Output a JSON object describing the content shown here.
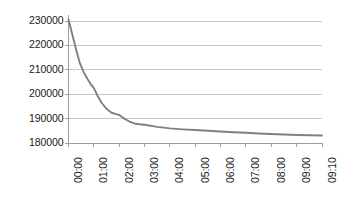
{
  "chart_data": {
    "type": "line",
    "title": "",
    "subtitle": "",
    "xlabel": "",
    "ylabel": "",
    "grid": "horizontal",
    "legend": "none",
    "ylim": [
      180000,
      230000
    ],
    "ytick_step": 10000,
    "ytick_labels": [
      "230000",
      "220000",
      "210000",
      "200000",
      "190000",
      "180000"
    ],
    "ytick_values": [
      230000,
      220000,
      210000,
      200000,
      190000,
      180000
    ],
    "categories": [
      "00:00",
      "01:00",
      "02:00",
      "03:00",
      "04:00",
      "05:00",
      "06:00",
      "07:00",
      "08:00",
      "09:00",
      "09:10"
    ],
    "x": [
      0,
      1,
      2,
      3,
      4,
      5,
      6,
      7,
      8,
      9,
      10
    ],
    "series": [
      {
        "name": "value",
        "color": "#808080",
        "values": [
          230600,
          202500,
          191500,
          187500,
          186000,
          185300,
          184700,
          184200,
          183700,
          183300,
          183100
        ]
      }
    ],
    "dense_x": [
      0,
      0.15,
      0.3,
      0.45,
      0.6,
      0.75,
      0.9,
      1,
      1.15,
      1.3,
      1.5,
      1.7,
      1.85,
      2,
      2.2,
      2.4,
      2.6,
      2.8,
      3,
      3.5,
      4,
      4.5,
      5,
      5.5,
      6,
      6.5,
      7,
      7.5,
      8,
      8.5,
      9,
      9.5,
      10
    ],
    "dense_values": [
      230600,
      224500,
      218300,
      212600,
      209000,
      206200,
      203800,
      202500,
      199300,
      196600,
      194000,
      192400,
      191900,
      191500,
      190000,
      188800,
      188000,
      187700,
      187500,
      186600,
      186000,
      185600,
      185300,
      185000,
      184700,
      184400,
      184200,
      183900,
      183700,
      183500,
      183300,
      183200,
      183100
    ],
    "axis_color": "#9e9e9e",
    "grid_color": "#c8c8c8",
    "tick_color": "#9e9e9e",
    "background": "#ffffff"
  }
}
